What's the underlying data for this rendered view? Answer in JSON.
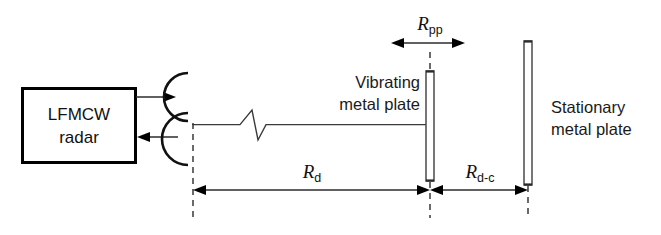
{
  "figure": {
    "type": "schematic-diagram",
    "background_color": "#ffffff",
    "line_color": "#000000"
  },
  "radar": {
    "label_line1": "LFMCW",
    "label_line2": "radar",
    "tx_arrow_name": "transmit-arrow",
    "rx_arrow_name": "receive-arrow"
  },
  "antennas": {
    "transmit_label": "transmit-antenna-arc",
    "receive_label": "receive-antenna-arc"
  },
  "plates": {
    "vibrating": {
      "line1": "Vibrating",
      "line2": "metal plate"
    },
    "stationary": {
      "line1": "Stationary",
      "line2": "metal plate"
    }
  },
  "dimensions": [
    {
      "id": "R_pp",
      "symbol": "R",
      "subscript": "pp",
      "meaning": "peak-to-peak vibration displacement",
      "style": "double-arrow"
    },
    {
      "id": "R_d",
      "symbol": "R",
      "subscript": "d",
      "meaning": "distance radar to vibrating plate",
      "style": "double-arrow"
    },
    {
      "id": "R_d-c",
      "symbol": "R",
      "subscript": "d-c",
      "meaning": "distance vibrating plate to stationary plate",
      "style": "double-arrow"
    }
  ],
  "break_symbol": {
    "name": "line-break-zigzag",
    "meaning": "path shortened / not to scale"
  }
}
